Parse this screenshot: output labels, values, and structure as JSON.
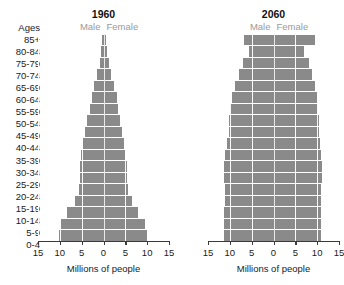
{
  "age_header": "Ages",
  "age_groups": [
    "85+",
    "80-84",
    "75-79",
    "70-74",
    "65-69",
    "60-64",
    "55-59",
    "50-54",
    "45-49",
    "40-44",
    "35-39",
    "30-34",
    "25-29",
    "20-24",
    "15-19",
    "10-14",
    "5-9",
    "0-4"
  ],
  "legend": {
    "male": "Male",
    "female": "Female"
  },
  "axis_title": "Millions of people",
  "tick_labels": [
    "15",
    "10",
    "5",
    "0",
    "5",
    "10",
    "15"
  ],
  "colors": {
    "bar": "#8a8a8a",
    "gridline": "#ffffff",
    "axis": "#3a3a3a",
    "legend_text": "#9a9a9a",
    "text": "#1a1a1a"
  },
  "panels": [
    {
      "title": "1960"
    },
    {
      "title": "2060"
    }
  ],
  "chart_data": {
    "type": "bar",
    "subtype": "population-pyramid",
    "xlabel": "Millions of people",
    "ylabel": "Ages",
    "xlim": [
      -15,
      15
    ],
    "xticks": [
      -15,
      -10,
      -5,
      0,
      5,
      10,
      15
    ],
    "xtick_labels": [
      "15",
      "10",
      "5",
      "0",
      "5",
      "10",
      "15"
    ],
    "grid": true,
    "legend": [
      "Male",
      "Female"
    ],
    "legend_position": "top",
    "categories": [
      "85+",
      "80-84",
      "75-79",
      "70-74",
      "65-69",
      "60-64",
      "55-59",
      "50-54",
      "45-49",
      "40-44",
      "35-39",
      "30-34",
      "25-29",
      "20-24",
      "15-19",
      "10-14",
      "5-9",
      "0-4"
    ],
    "panels": [
      {
        "title": "1960",
        "series": [
          {
            "name": "Male",
            "values": [
              0.3,
              0.5,
              0.9,
              1.5,
              2.1,
              2.7,
              3.2,
              3.7,
              4.2,
              4.6,
              5.1,
              5.4,
              5.4,
              5.5,
              6.6,
              8.3,
              9.8,
              10.3
            ]
          },
          {
            "name": "Female",
            "values": [
              0.5,
              0.7,
              1.2,
              1.8,
              2.4,
              3.0,
              3.4,
              3.8,
              4.2,
              4.6,
              5.0,
              5.3,
              5.4,
              5.6,
              6.5,
              8.0,
              9.5,
              9.9
            ]
          }
        ]
      },
      {
        "title": "2060",
        "series": [
          {
            "name": "Male",
            "values": [
              6.7,
              5.6,
              7.1,
              8.0,
              8.9,
              9.6,
              10.0,
              10.2,
              10.3,
              10.6,
              11.0,
              11.3,
              11.3,
              11.2,
              11.2,
              11.3,
              11.4,
              11.4
            ]
          },
          {
            "name": "Female",
            "values": [
              9.4,
              7.0,
              8.2,
              8.9,
              9.5,
              10.0,
              10.3,
              10.4,
              10.4,
              10.6,
              10.9,
              11.1,
              11.1,
              10.9,
              10.8,
              10.9,
              10.9,
              10.9
            ]
          }
        ]
      }
    ]
  }
}
